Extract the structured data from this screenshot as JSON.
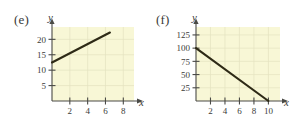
{
  "figure": {
    "background_color": "#ffffff",
    "panels": [
      {
        "label": "(e)",
        "x_axis_letter": "x",
        "y_axis_letter": "y"
      },
      {
        "label": "(f)",
        "x_axis_letter": "x",
        "y_axis_letter": "y"
      }
    ]
  },
  "chart_data": [
    {
      "type": "line",
      "title": "(e)",
      "xlabel": "x",
      "ylabel": "y",
      "xlim": [
        0,
        9.2
      ],
      "ylim": [
        0,
        24
      ],
      "xticks": [
        2,
        4,
        6,
        8
      ],
      "yticks": [
        5,
        10,
        15,
        20
      ],
      "grid": true,
      "plot_background": "#f8f7d6",
      "line_color": "#2e2a16",
      "series": [
        {
          "name": "line-e",
          "points": [
            [
              0,
              12.5
            ],
            [
              6.5,
              22.2
            ]
          ],
          "slope": 1.5,
          "intercept": 12.5
        }
      ]
    },
    {
      "type": "line",
      "title": "(f)",
      "xlabel": "x",
      "ylabel": "y",
      "xlim": [
        0,
        11.6
      ],
      "ylim": [
        0,
        140
      ],
      "xticks": [
        2,
        4,
        6,
        8,
        10
      ],
      "yticks": [
        25,
        50,
        75,
        100,
        125
      ],
      "grid": true,
      "plot_background": "#f8f7d6",
      "line_color": "#2e2a16",
      "series": [
        {
          "name": "line-f",
          "points": [
            [
              0,
              100
            ],
            [
              10,
              0
            ]
          ],
          "slope": -10,
          "intercept": 100
        }
      ]
    }
  ]
}
